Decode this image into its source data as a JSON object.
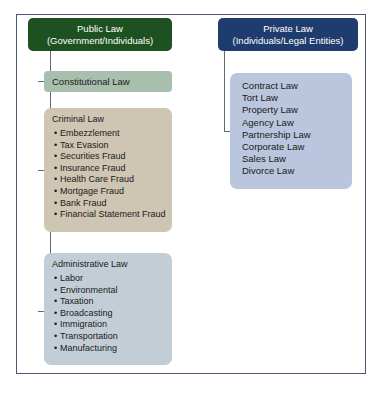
{
  "diagram": {
    "colors": {
      "public_law_header_bg": "#1d5120",
      "private_law_header_bg": "#1f3c6e",
      "constitutional_law_bg": "#a9bfae",
      "criminal_law_bg": "#cfc5b3",
      "administrative_law_bg": "#c3cdd6",
      "private_law_list_bg": "#b9c6dd",
      "frame_border": "#4a5a72",
      "connector_line": "#5d6b80",
      "text": "#1a1a1a",
      "header_text": "#ffffff"
    },
    "public_law": {
      "header_line1": "Public Law",
      "header_line2": "(Government/Individuals)",
      "branches": [
        {
          "name": "Constitutional Law",
          "items": []
        },
        {
          "name": "Criminal Law",
          "items": [
            "Embezzlement",
            "Tax Evasion",
            "Securities Fraud",
            "Insurance Fraud",
            "Health Care Fraud",
            "Mortgage Fraud",
            "Bank Fraud",
            "Financial Statement Fraud"
          ]
        },
        {
          "name": "Administrative Law",
          "items": [
            "Labor",
            "Environmental",
            "Taxation",
            "Broadcasting",
            "Immigration",
            "Transportation",
            "Manufacturing"
          ]
        }
      ]
    },
    "private_law": {
      "header_line1": "Private Law",
      "header_line2": "(Individuals/Legal Entities)",
      "items": [
        "Contract Law",
        "Tort Law",
        "Property Law",
        "Agency Law",
        "Partnership Law",
        "Corporate Law",
        "Sales Law",
        "Divorce Law"
      ]
    }
  }
}
